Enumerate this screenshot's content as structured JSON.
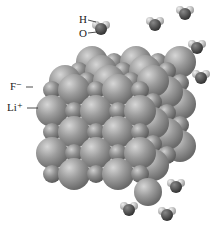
{
  "labels": {
    "hydrogen": "H",
    "oxygen": "O",
    "fluoride": "F⁻",
    "lithium": "Li⁺"
  },
  "colors": {
    "fluoride": "#9a9a9a",
    "lithium": "#8f8f8f",
    "oxygen": "#555555",
    "hydrogen": "#c8c8c8",
    "label": "#222222"
  }
}
